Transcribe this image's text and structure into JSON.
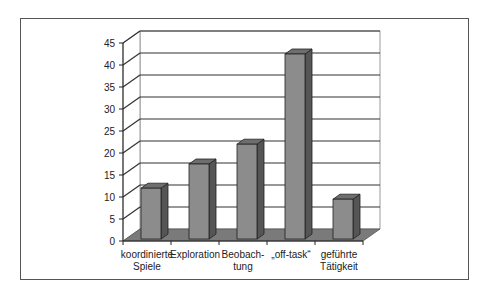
{
  "chart_data": {
    "type": "bar",
    "title": "",
    "xlabel": "",
    "ylabel": "",
    "categories": [
      "koordinierte Spiele",
      "Exploration",
      "Beobachtung",
      "„off-task“",
      "geführte Tätigkeit"
    ],
    "category_lines": [
      [
        "koordinierte",
        "Spiele"
      ],
      [
        "Exploration"
      ],
      [
        "Beobach-",
        "tung"
      ],
      [
        "„off-task“"
      ],
      [
        "geführte",
        "Tätigkeit"
      ]
    ],
    "values": [
      12,
      17.5,
      22,
      42.5,
      9.5
    ],
    "ylim": [
      0,
      45
    ],
    "yticks": [
      0,
      5,
      10,
      15,
      20,
      25,
      30,
      35,
      40,
      45
    ],
    "grid": true,
    "legend": null,
    "style": "3d-column",
    "colors": {
      "bar_front": "#8c8c8c",
      "bar_side": "#555555",
      "bar_top": "#6e6e6e",
      "floor": "#7a7a7a",
      "grid": "#333333"
    }
  }
}
